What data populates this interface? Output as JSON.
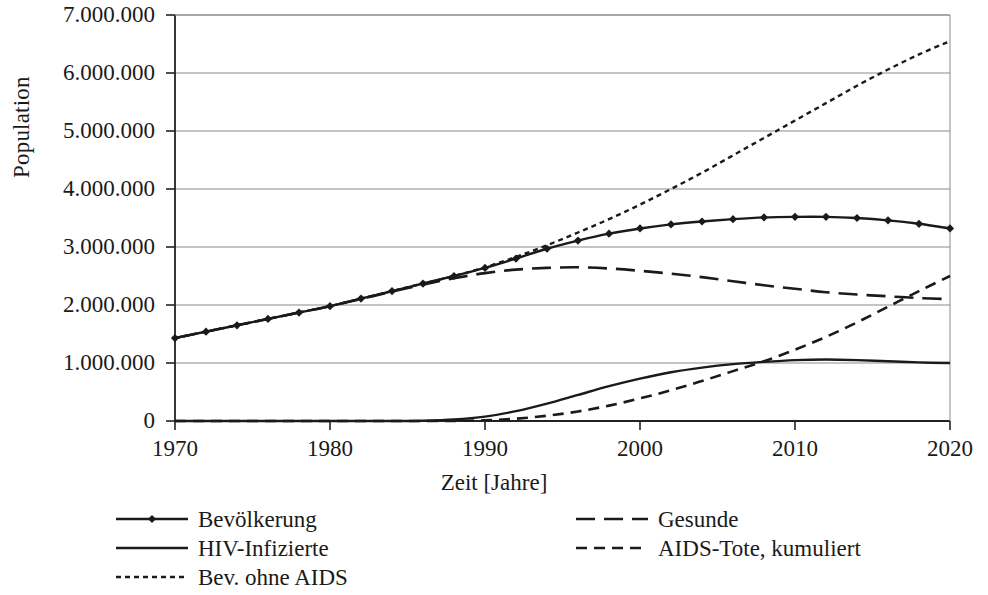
{
  "axes": {
    "ylabel": "Population",
    "xlabel": "Zeit [Jahre]",
    "yticks": [
      "0",
      "1.000.000",
      "2.000.000",
      "3.000.000",
      "4.000.000",
      "5.000.000",
      "6.000.000",
      "7.000.000"
    ],
    "xticks": [
      "1970",
      "1980",
      "1990",
      "2000",
      "2010",
      "2020"
    ]
  },
  "legend": {
    "items": [
      {
        "label": "Bevölkerung",
        "style": "solid-marker"
      },
      {
        "label": "HIV-Infizierte",
        "style": "solid"
      },
      {
        "label": "Bev. ohne AIDS",
        "style": "dotted"
      },
      {
        "label": "Gesunde",
        "style": "dashed-long"
      },
      {
        "label": "AIDS-Tote, kumuliert",
        "style": "dashed"
      }
    ]
  },
  "colors": {
    "ink": "#1a1a1a",
    "grid": "#8a8a8a",
    "axis": "#222222"
  },
  "chart_data": {
    "type": "line",
    "title": "",
    "xlabel": "Zeit [Jahre]",
    "ylabel": "Population",
    "xlim": [
      1970,
      2020
    ],
    "ylim": [
      0,
      7000000
    ],
    "ytick_step": 1000000,
    "xtick_step": 10,
    "grid": "horizontal",
    "legend_position": "below-plot",
    "x": [
      1970,
      1972,
      1974,
      1976,
      1978,
      1980,
      1982,
      1984,
      1986,
      1988,
      1990,
      1992,
      1994,
      1996,
      1998,
      2000,
      2002,
      2004,
      2006,
      2008,
      2010,
      2012,
      2014,
      2016,
      2018,
      2020
    ],
    "series": [
      {
        "name": "Bevölkerung",
        "style": "solid-marker",
        "marker": "diamond",
        "values": [
          1430000,
          1540000,
          1650000,
          1760000,
          1870000,
          1980000,
          2110000,
          2240000,
          2370000,
          2500000,
          2640000,
          2800000,
          2970000,
          3110000,
          3230000,
          3320000,
          3390000,
          3440000,
          3480000,
          3510000,
          3520000,
          3520000,
          3500000,
          3460000,
          3400000,
          3320000
        ]
      },
      {
        "name": "HIV-Infizierte",
        "style": "solid",
        "values": [
          0,
          0,
          0,
          0,
          0,
          0,
          0,
          0,
          5000,
          25000,
          75000,
          170000,
          300000,
          450000,
          600000,
          730000,
          840000,
          920000,
          980000,
          1020000,
          1050000,
          1060000,
          1050000,
          1030000,
          1010000,
          1000000
        ]
      },
      {
        "name": "Bev. ohne AIDS",
        "style": "dotted",
        "values": [
          1430000,
          1540000,
          1650000,
          1760000,
          1870000,
          1980000,
          2110000,
          2240000,
          2370000,
          2500000,
          2650000,
          2830000,
          3030000,
          3250000,
          3480000,
          3730000,
          4000000,
          4280000,
          4580000,
          4880000,
          5180000,
          5480000,
          5780000,
          6060000,
          6320000,
          6550000
        ]
      },
      {
        "name": "Gesunde",
        "style": "dashed-long",
        "values": [
          1430000,
          1540000,
          1650000,
          1760000,
          1870000,
          1980000,
          2105000,
          2230000,
          2350000,
          2460000,
          2550000,
          2610000,
          2640000,
          2650000,
          2630000,
          2590000,
          2540000,
          2480000,
          2410000,
          2340000,
          2280000,
          2220000,
          2180000,
          2150000,
          2120000,
          2100000
        ]
      },
      {
        "name": "AIDS-Tote, kumuliert",
        "style": "dashed",
        "values": [
          0,
          0,
          0,
          0,
          0,
          0,
          0,
          0,
          0,
          2000,
          12000,
          40000,
          90000,
          165000,
          265000,
          390000,
          530000,
          690000,
          860000,
          1030000,
          1230000,
          1450000,
          1700000,
          1970000,
          2240000,
          2500000
        ]
      }
    ]
  }
}
